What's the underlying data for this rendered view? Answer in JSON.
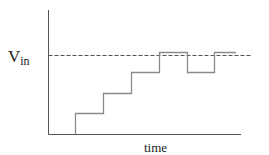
{
  "diagram": {
    "ylabel_main": "V",
    "ylabel_sub": "in",
    "xlabel": "time",
    "colors": {
      "axis": "#555555",
      "signal": "#8a8a8a",
      "reference": "#555555"
    },
    "reference_line": {
      "label": "Vin",
      "y": 55
    },
    "signal_steps": [
      {
        "x": 75,
        "y": 113
      },
      {
        "x": 103,
        "y": 93
      },
      {
        "x": 131,
        "y": 72
      },
      {
        "x": 159,
        "y": 52
      },
      {
        "x": 187,
        "y": 72
      },
      {
        "x": 214,
        "y": 52
      }
    ]
  }
}
